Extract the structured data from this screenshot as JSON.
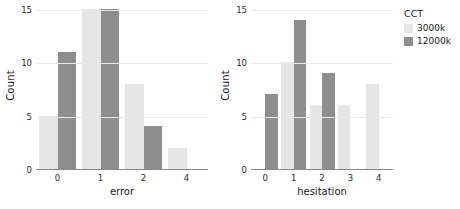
{
  "chart_data": {
    "type": "bar",
    "title": "",
    "ylabel": "Count",
    "ylim": [
      0,
      15
    ],
    "yticks": [
      0,
      5,
      10,
      15
    ],
    "grid": true,
    "legend": {
      "title": "CCT",
      "position": "right",
      "entries": [
        {
          "name": "3000k",
          "color": "#e6e6e6"
        },
        {
          "name": "12000k",
          "color": "#8e8e8e"
        }
      ]
    },
    "panels": [
      {
        "id": "error",
        "xlabel": "error",
        "categories": [
          "0",
          "1",
          "2",
          "4"
        ],
        "series": [
          {
            "name": "3000k",
            "color": "#e6e6e6",
            "values": [
              5,
              15,
              8,
              2
            ]
          },
          {
            "name": "12000k",
            "color": "#8e8e8e",
            "values": [
              11,
              15,
              4,
              null
            ]
          }
        ]
      },
      {
        "id": "hesitation",
        "xlabel": "hesitation",
        "categories": [
          "0",
          "1",
          "2",
          "3",
          "4"
        ],
        "series": [
          {
            "name": "3000k",
            "color": "#e6e6e6",
            "values": [
              null,
              10,
              6,
              6,
              8
            ]
          },
          {
            "name": "12000k",
            "color": "#8e8e8e",
            "values": [
              7,
              14,
              9,
              null,
              null
            ]
          }
        ]
      }
    ]
  },
  "colors": {
    "background": "#ffffff",
    "gridline": "#e9e9e9",
    "axis": "#8a8a8a",
    "text": "#1a1a1a",
    "light_bar": "#e6e6e6",
    "dark_bar": "#8e8e8e"
  }
}
